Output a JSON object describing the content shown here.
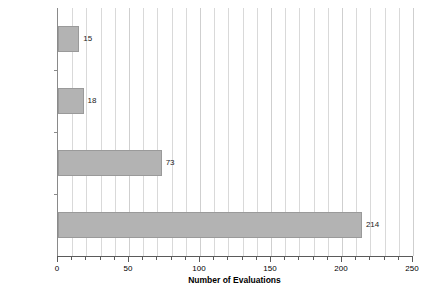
{
  "chart_data": {
    "type": "bar",
    "orientation": "horizontal",
    "title": "",
    "xlabel": "Number of Evaluations",
    "ylabel": "",
    "xlim": [
      0,
      250
    ],
    "ylim": null,
    "grid": true,
    "grid_axis": "x",
    "grid_interval": 10,
    "legend": false,
    "legend_position": "none",
    "bar_color": "#b3b3b3",
    "bar_edge_color": "#9a9a9a",
    "categories": [
      "Example",
      "Analytic",
      "Case Study",
      "Experiment"
    ],
    "category_percents": [
      "(%4.38)",
      "(%5.63)",
      "(%23.13)",
      "(%66.88)"
    ],
    "values": [
      15,
      18,
      73,
      214
    ],
    "value_labels": [
      "15",
      "18",
      "73",
      "214"
    ],
    "xticks": [
      0,
      50,
      100,
      150,
      200,
      250
    ],
    "xtick_labels": [
      "0",
      "50",
      "100",
      "150",
      "200",
      "250"
    ],
    "xtick_minor_interval": 10
  }
}
